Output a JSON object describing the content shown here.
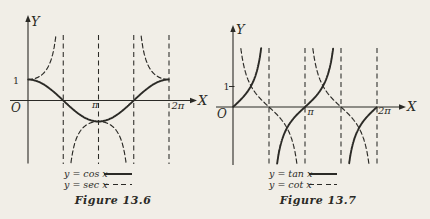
{
  "page": {
    "background": "#f1eee7",
    "ink": "#2b2a26"
  },
  "chart_data": [
    {
      "type": "line",
      "title": "Figure 13.6",
      "xlabel": "X",
      "ylabel": "Y",
      "origin_label": "O",
      "x_range_pi": [
        0,
        2
      ],
      "ylim": [
        -2.98,
        3.07
      ],
      "grid": false,
      "legend_position": "bottom-center",
      "x_ticks": [
        {
          "pi": 1,
          "label": "π"
        },
        {
          "pi": 2,
          "label": "2π"
        }
      ],
      "y_ticks": [
        {
          "value": 1,
          "label": "1"
        }
      ],
      "asymptote_guides_pi": [
        0.5,
        1,
        1.5,
        2
      ],
      "series": [
        {
          "name": "y = cos x",
          "fn": "cos",
          "style": "solid",
          "key_points_pi": [
            [
              0,
              1
            ],
            [
              0.5,
              0
            ],
            [
              1,
              -1
            ],
            [
              1.5,
              0
            ],
            [
              2,
              1
            ]
          ]
        },
        {
          "name": "y = sec x",
          "fn": "sec",
          "style": "dashed",
          "asymptotes_pi": [
            0.5,
            1.5
          ],
          "key_points_pi": [
            [
              0,
              1
            ],
            [
              1,
              -1
            ],
            [
              2,
              1
            ]
          ]
        }
      ]
    },
    {
      "type": "line",
      "title": "Figure 13.7",
      "xlabel": "X",
      "ylabel": "Y",
      "origin_label": "O",
      "x_range_pi": [
        0,
        2
      ],
      "ylim": [
        -2.71,
        2.81
      ],
      "grid": false,
      "legend_position": "bottom-center",
      "x_ticks": [
        {
          "pi": 1,
          "label": "π"
        },
        {
          "pi": 2,
          "label": "2π"
        }
      ],
      "y_ticks": [
        {
          "value": 1,
          "label": "1",
          "tick_mark": true
        }
      ],
      "asymptote_guides_pi": [
        0.5,
        1,
        1.5,
        2
      ],
      "series": [
        {
          "name": "y = tan x",
          "fn": "tan",
          "style": "solid",
          "asymptotes_pi": [
            0.5,
            1.5
          ],
          "key_points_pi": [
            [
              0,
              0
            ],
            [
              0.25,
              1
            ],
            [
              1,
              0
            ],
            [
              1.25,
              1
            ],
            [
              2,
              0
            ]
          ]
        },
        {
          "name": "y = cot x",
          "fn": "cot",
          "style": "dashed",
          "asymptotes_pi": [
            1,
            2
          ],
          "key_points_pi": [
            [
              0.25,
              1
            ],
            [
              0.5,
              0
            ],
            [
              1.25,
              1
            ],
            [
              1.5,
              0
            ]
          ]
        }
      ]
    }
  ]
}
